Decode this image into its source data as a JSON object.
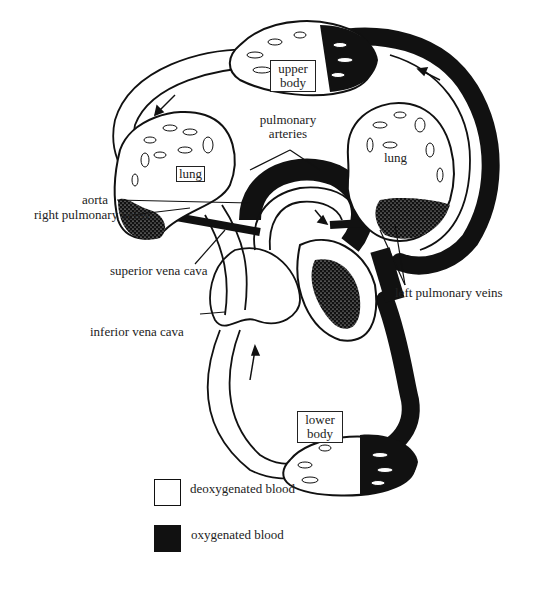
{
  "diagram": {
    "title": "",
    "regions": {
      "upper_body": "upper body",
      "upper_body_line1": "upper",
      "upper_body_line2": "body",
      "lower_body_line1": "lower",
      "lower_body_line2": "body",
      "lung_left": "lung",
      "lung_right": "lung"
    },
    "labels": {
      "pulmonary_arteries_line1": "pulmonary",
      "pulmonary_arteries_line2": "arteries",
      "aorta": "aorta",
      "right_pulmonary_veins": "right pulmonary veins",
      "superior_vena_cava": "superior vena cava",
      "inferior_vena_cava": "inferior vena cava",
      "left_pulmonary_veins": "left pulmonary veins"
    },
    "colors": {
      "deoxygenated": "#ffffff",
      "oxygenated": "#111111",
      "outline": "#111111"
    }
  },
  "legend": {
    "items": [
      {
        "label": "deoxygenated blood",
        "color": "#ffffff"
      },
      {
        "label": "oxygenated blood",
        "color": "#111111"
      }
    ]
  }
}
